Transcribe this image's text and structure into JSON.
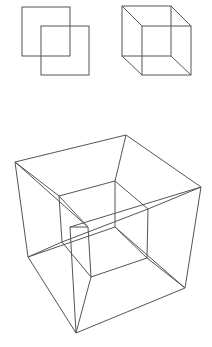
{
  "diagram": {
    "stroke_color": "#555555",
    "background": "#ffffff",
    "figures": [
      {
        "name": "overlapping-squares",
        "label": "2D squares"
      },
      {
        "name": "cube",
        "label": "3D cube"
      },
      {
        "name": "tesseract",
        "label": "4D tesseract"
      }
    ]
  }
}
